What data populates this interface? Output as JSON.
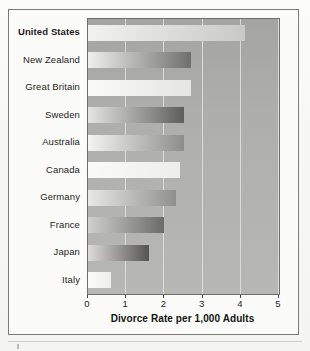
{
  "chart_data": {
    "type": "bar",
    "orientation": "horizontal",
    "title": "",
    "xlabel": "Divorce Rate per 1,000 Adults",
    "ylabel": "",
    "xlim": [
      0,
      5
    ],
    "xticks": [
      "0",
      "1",
      "2",
      "3",
      "4",
      "5"
    ],
    "grid": true,
    "legend": "none",
    "categories": [
      "United States",
      "New Zealand",
      "Great Britain",
      "Sweden",
      "Australia",
      "Canada",
      "Germany",
      "France",
      "Japan",
      "Italy"
    ],
    "values": [
      4.1,
      2.7,
      2.7,
      2.5,
      2.5,
      2.4,
      2.3,
      2.0,
      1.6,
      0.6
    ],
    "highlighted_category": "United States",
    "bars": [
      {
        "label": "United States",
        "value": 4.1,
        "gradient_start": "#f2f2f0",
        "gradient_end": "#c9c9c6"
      },
      {
        "label": "New Zealand",
        "value": 2.7,
        "gradient_start": "#efefec",
        "gradient_end": "#6f6f6d"
      },
      {
        "label": "Great Britain",
        "value": 2.7,
        "gradient_start": "#fafaf8",
        "gradient_end": "#e5e5e2"
      },
      {
        "label": "Sweden",
        "value": 2.5,
        "gradient_start": "#e4e4e1",
        "gradient_end": "#5e5e5c"
      },
      {
        "label": "Australia",
        "value": 2.5,
        "gradient_start": "#f4f4f1",
        "gradient_end": "#8d8d8a"
      },
      {
        "label": "Canada",
        "value": 2.4,
        "gradient_start": "#fafaf8",
        "gradient_end": "#ededea"
      },
      {
        "label": "Germany",
        "value": 2.3,
        "gradient_start": "#e8e8e5",
        "gradient_end": "#8f8f8c"
      },
      {
        "label": "France",
        "value": 2.0,
        "gradient_start": "#d0d0cd",
        "gradient_end": "#6b6b69"
      },
      {
        "label": "Japan",
        "value": 1.6,
        "gradient_start": "#dedbdb",
        "gradient_end": "#545452"
      },
      {
        "label": "Italy",
        "value": 0.6,
        "gradient_start": "#fbfbf9",
        "gradient_end": "#eeeeeb"
      }
    ],
    "colors": {
      "plot_background": "#aeaeac",
      "plot_border": "#6e6e6c",
      "gridline": "#e3e3e0",
      "axis_text": "#1d1d1d",
      "figure_frame": "#7b7b78",
      "page_background": "#fbfbf9"
    }
  }
}
